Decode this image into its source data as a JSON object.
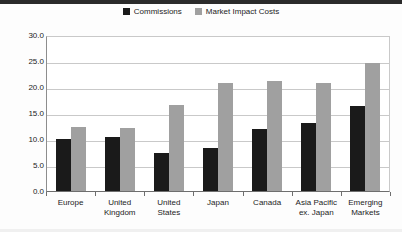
{
  "chart_data": {
    "type": "bar",
    "title": "",
    "subtitle": "",
    "xlabel": "",
    "ylabel": "",
    "ylim": [
      0,
      30
    ],
    "ytick_step": 5,
    "yticks": [
      "30.0",
      "25.0",
      "20.0",
      "15.0",
      "10.0",
      "5.0",
      "0.0"
    ],
    "grid": true,
    "legend_position": "top-center",
    "categories": [
      "Europe",
      "United Kingdom",
      "United States",
      "Japan",
      "Canada",
      "Asia Pacific ex. Japan",
      "Emerging Markets"
    ],
    "series": [
      {
        "name": "Commissions",
        "color": "#1a1a1a",
        "values": [
          10.0,
          10.3,
          7.3,
          8.2,
          11.9,
          13.1,
          16.4
        ]
      },
      {
        "name": "Market Impact Costs",
        "color": "#a0a0a0",
        "values": [
          12.4,
          12.2,
          16.5,
          20.8,
          21.2,
          20.7,
          24.6
        ]
      }
    ]
  },
  "legend": {
    "entries": [
      {
        "label": "Commissions",
        "color": "#1a1a1a"
      },
      {
        "label": "Market Impact Costs",
        "color": "#a0a0a0"
      }
    ]
  }
}
